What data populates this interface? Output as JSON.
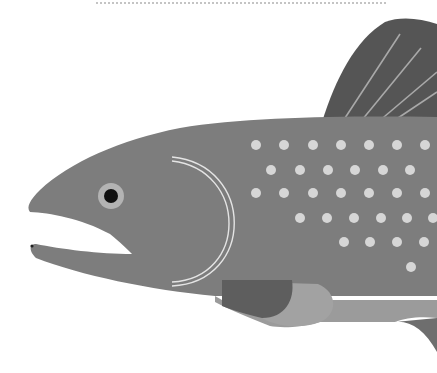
{
  "illustration": {
    "subject": "Fish head illustration (salmon / trout)",
    "colors": {
      "background": "#ffffff",
      "body": "#7d7d7d",
      "dorsal_fin": "#555555",
      "fin_rays": "#a9a9a9",
      "spots": "#d6d6d6",
      "gill_lines": "#e4e4e4",
      "eye_ring": "#b3b3b3",
      "pupil": "#111111",
      "pectoral_dark": "#5e5e5e",
      "pectoral_light": "#a2a2a2",
      "belly": "#9b9b9b",
      "dotted_rule": "#c4c4c4"
    },
    "eye": {
      "cx": 111,
      "cy": 196,
      "ring_r": 13,
      "pupil_r": 7
    },
    "spots": [
      [
        256,
        145
      ],
      [
        284,
        145
      ],
      [
        313,
        145
      ],
      [
        341,
        145
      ],
      [
        369,
        145
      ],
      [
        397,
        145
      ],
      [
        425,
        145
      ],
      [
        271,
        170
      ],
      [
        300,
        170
      ],
      [
        328,
        170
      ],
      [
        355,
        170
      ],
      [
        383,
        170
      ],
      [
        410,
        170
      ],
      [
        256,
        193
      ],
      [
        284,
        193
      ],
      [
        313,
        193
      ],
      [
        341,
        193
      ],
      [
        369,
        193
      ],
      [
        397,
        193
      ],
      [
        425,
        193
      ],
      [
        300,
        218
      ],
      [
        327,
        218
      ],
      [
        354,
        218
      ],
      [
        381,
        218
      ],
      [
        407,
        218
      ],
      [
        433,
        218
      ],
      [
        344,
        242
      ],
      [
        370,
        242
      ],
      [
        397,
        242
      ],
      [
        424,
        242
      ],
      [
        411,
        267
      ]
    ],
    "spot_radius": 5
  }
}
